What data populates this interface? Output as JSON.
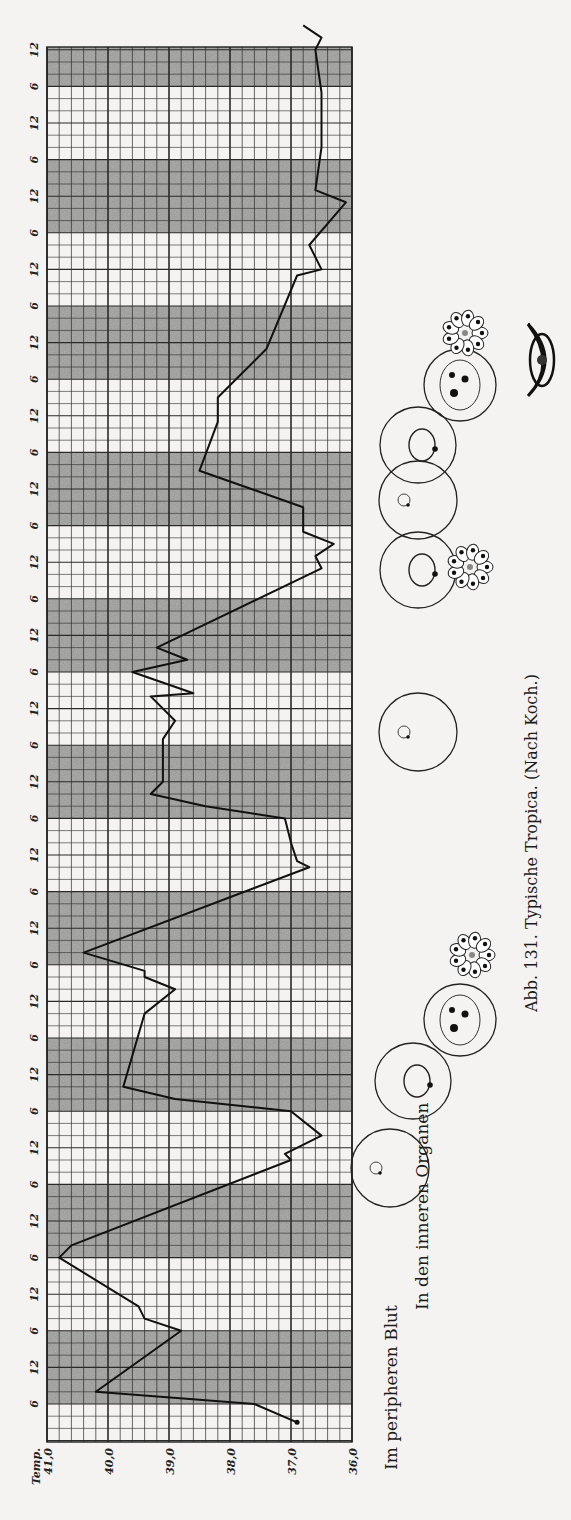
{
  "chart_data": {
    "type": "line",
    "title": "Abb. 131. Typische Tropica. (Nach Koch.)",
    "orientation": "rotated-90-ccw",
    "ylabel": "Temp.",
    "ylim": [
      36.0,
      41.0
    ],
    "y_ticks": [
      "41,0",
      "40,0",
      "39,0",
      "38,0",
      "37,0",
      "36,0"
    ],
    "y_tick_values": [
      41.0,
      40.0,
      39.0,
      38.0,
      37.0,
      36.0
    ],
    "x_tick_pattern": [
      "6",
      "12"
    ],
    "x_tick_labels": [
      "6",
      "12",
      "6",
      "12",
      "6",
      "12",
      "6",
      "12",
      "6",
      "12",
      "6",
      "12",
      "6",
      "12",
      "6",
      "12",
      "6",
      "12",
      "6",
      "12",
      "6",
      "12",
      "6",
      "12",
      "6",
      "12",
      "6",
      "12",
      "6",
      "12",
      "6",
      "12",
      "6",
      "12",
      "6",
      "12",
      "6",
      "12"
    ],
    "x_unit": "hours (2 h per grid row, alternating 12 h shaded bands)",
    "grid": true,
    "grid_minor_temp_step": 0.2,
    "hours_per_row": 2,
    "total_hours": 228,
    "series": [
      {
        "name": "Temperatur",
        "points_hours_temp": [
          [
            -3,
            36.9
          ],
          [
            0,
            37.6
          ],
          [
            2,
            40.2
          ],
          [
            12,
            38.8
          ],
          [
            14,
            39.4
          ],
          [
            16,
            39.5
          ],
          [
            24,
            40.8
          ],
          [
            26,
            40.6
          ],
          [
            40,
            37.0
          ],
          [
            41,
            37.1
          ],
          [
            44,
            36.5
          ],
          [
            48,
            37.0
          ],
          [
            50,
            38.9
          ],
          [
            52,
            39.75
          ],
          [
            64,
            39.4
          ],
          [
            68,
            38.9
          ],
          [
            70,
            39.4
          ],
          [
            71,
            39.4
          ],
          [
            74,
            40.4
          ],
          [
            88,
            36.7
          ],
          [
            89,
            36.9
          ],
          [
            92,
            37.0
          ],
          [
            96,
            37.1
          ],
          [
            98,
            38.4
          ],
          [
            100,
            39.3
          ],
          [
            102,
            39.1
          ],
          [
            109,
            39.1
          ],
          [
            112,
            38.9
          ],
          [
            116,
            39.3
          ],
          [
            116.5,
            38.6
          ],
          [
            120,
            39.6
          ],
          [
            122,
            38.7
          ],
          [
            124,
            39.2
          ],
          [
            137,
            36.5
          ],
          [
            139,
            36.6
          ],
          [
            141,
            36.3
          ],
          [
            143,
            36.8
          ],
          [
            147,
            36.8
          ],
          [
            153,
            38.5
          ],
          [
            161,
            38.2
          ],
          [
            163,
            38.2
          ],
          [
            165,
            38.2
          ],
          [
            167,
            38.0
          ],
          [
            173,
            37.4
          ],
          [
            185,
            36.9
          ],
          [
            186,
            36.5
          ],
          [
            190,
            36.7
          ],
          [
            197,
            36.1
          ],
          [
            199,
            36.6
          ],
          [
            206,
            36.5
          ],
          [
            207,
            36.5
          ],
          [
            215,
            36.5
          ],
          [
            222,
            36.6
          ],
          [
            224,
            36.5
          ],
          [
            226,
            36.8
          ]
        ]
      }
    ],
    "shaded_bands_start_hours": [
      0,
      24,
      48,
      72,
      96,
      120,
      144,
      168,
      192,
      216
    ],
    "shaded_band_length_hours": 12
  },
  "labels": {
    "temp_axis_title": "Temp.",
    "peripheral_blood": "Im peripheren Blut",
    "inner_organs": "In den inneren Organen",
    "caption": "Abb. 131.  Typische Tropica.  (Nach Koch.)"
  },
  "colors": {
    "paper": "#f4f3f1",
    "grid_line": "#2a2a2a",
    "shade": "#8e8e8e",
    "curve": "#111111"
  },
  "illustrations": [
    {
      "name": "ring-stage-small",
      "cx": 390,
      "cy": 1168,
      "r": 39
    },
    {
      "name": "ring-stage-large",
      "cx": 413,
      "cy": 1081,
      "r": 38
    },
    {
      "name": "schizont-cell",
      "cx": 460,
      "cy": 1020,
      "r": 36
    },
    {
      "name": "merozoite-rosette",
      "cx": 472,
      "cy": 955,
      "r": 28
    },
    {
      "name": "ring-stage-small-2",
      "cx": 418,
      "cy": 732,
      "r": 39
    },
    {
      "name": "ring-stage-large-2",
      "cx": 418,
      "cy": 570,
      "r": 38
    },
    {
      "name": "merozoite-rosette-2",
      "cx": 470,
      "cy": 567,
      "r": 28
    },
    {
      "name": "ring-stage-small-3",
      "cx": 418,
      "cy": 500,
      "r": 39
    },
    {
      "name": "ring-stage-large-3",
      "cx": 418,
      "cy": 445,
      "r": 38
    },
    {
      "name": "schizont-cell-2",
      "cx": 460,
      "cy": 385,
      "r": 36
    },
    {
      "name": "merozoite-rosette-3",
      "cx": 465,
      "cy": 333,
      "r": 28
    },
    {
      "name": "crescent-gametocyte",
      "cx": 540,
      "cy": 360,
      "r": 30
    }
  ]
}
